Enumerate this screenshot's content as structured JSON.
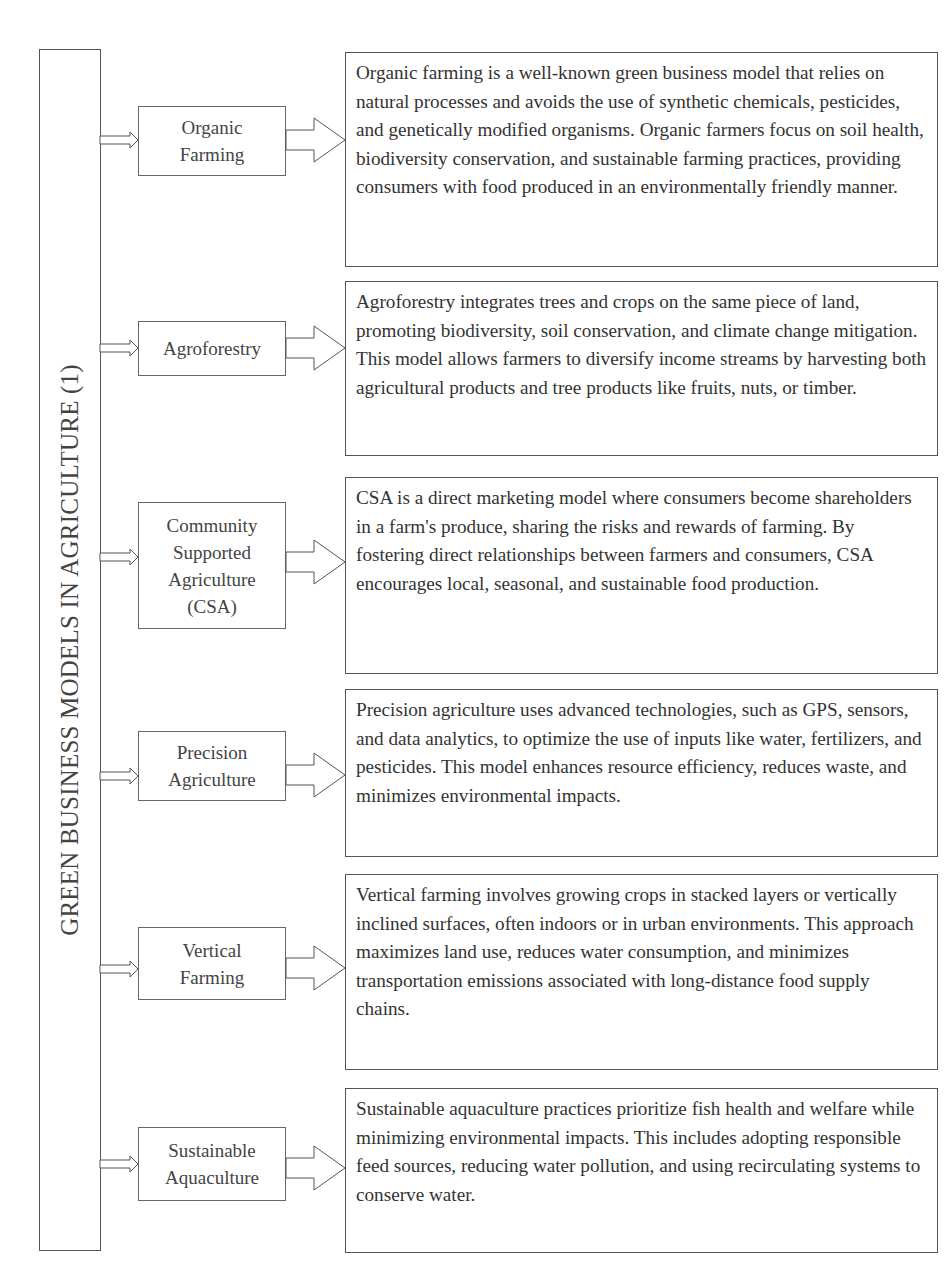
{
  "diagram": {
    "title": "GREEN BUSINESS MODELS IN AGRICULTURE (1)",
    "colors": {
      "stroke": "#555555",
      "text": "#333333",
      "background": "#ffffff"
    },
    "items": [
      {
        "label_lines": [
          "Organic",
          "Farming"
        ],
        "label": "Organic Farming",
        "description": "Organic farming is a well-known green business model that relies on natural processes and avoids the use of synthetic chemicals, pesticides, and genetically modified organisms. Organic farmers focus on soil health, biodiversity conservation, and sustainable farming practices, providing consumers with food produced in an environmentally friendly manner."
      },
      {
        "label_lines": [
          "Agroforestry"
        ],
        "label": "Agroforestry",
        "description": "Agroforestry integrates trees and crops on the same piece of land, promoting biodiversity, soil conservation, and climate change mitigation. This model allows farmers to diversify income streams by harvesting both agricultural products and tree products like fruits, nuts, or timber."
      },
      {
        "label_lines": [
          "Community",
          "Supported",
          "Agriculture",
          "(CSA)"
        ],
        "label": "Community Supported Agriculture (CSA)",
        "description": "CSA is a direct marketing model where consumers become shareholders in a farm's produce, sharing the risks and rewards of farming. By fostering direct relationships between farmers and consumers, CSA encourages local, seasonal, and sustainable food production."
      },
      {
        "label_lines": [
          "Precision",
          "Agriculture"
        ],
        "label": "Precision Agriculture",
        "description": "Precision agriculture uses advanced technologies, such as GPS, sensors, and data analytics, to optimize the use of inputs like water, fertilizers, and pesticides. This model enhances resource efficiency, reduces waste, and minimizes environmental impacts."
      },
      {
        "label_lines": [
          "Vertical",
          "Farming"
        ],
        "label": "Vertical Farming",
        "description": "Vertical farming involves growing crops in stacked layers or vertically inclined surfaces, often indoors or in urban environments. This approach maximizes land use, reduces water consumption, and minimizes transportation emissions associated with long-distance food supply chains."
      },
      {
        "label_lines": [
          "Sustainable",
          "Aquaculture"
        ],
        "label": "Sustainable Aquaculture",
        "description": "Sustainable aquaculture practices prioritize fish health and welfare while minimizing environmental impacts. This includes adopting responsible feed sources, reducing water pollution, and using recirculating systems to conserve water."
      }
    ]
  }
}
